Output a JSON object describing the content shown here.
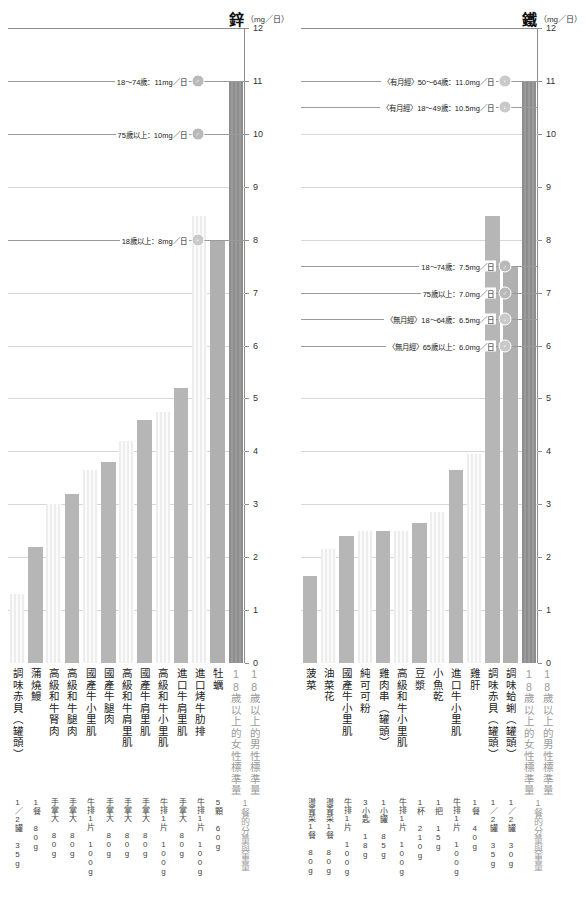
{
  "charts": [
    {
      "id": "zinc",
      "title": "鋅",
      "unit": "（mg／日）",
      "ylim": [
        0,
        12
      ],
      "yticks": [
        "0",
        "1",
        "2",
        "3",
        "4",
        "5",
        "6",
        "7",
        "8",
        "9",
        "10",
        "11",
        "12"
      ],
      "categories": [
        "調味赤貝（罐頭）",
        "蒲燒鰻",
        "高級和牛腎肉",
        "高級和牛腿肉",
        "國產牛小里肌",
        "國產牛腿肉",
        "高級和牛肩里肌",
        "國產牛肩里肌",
        "高級和牛小里肌",
        "進口牛肩里肌",
        "進口烤牛肋排",
        "牡蠣"
      ],
      "values": [
        1.3,
        2.2,
        3.0,
        3.2,
        3.65,
        3.8,
        4.2,
        4.6,
        4.75,
        5.2,
        8.45
      ],
      "patterns": [
        "stripe",
        "solid",
        "stripe",
        "solid",
        "stripe",
        "solid",
        "stripe",
        "solid",
        "stripe",
        "solid",
        "stripe"
      ],
      "servings": [
        "1／2罐 35g",
        "1餐 80g",
        "手掌大 80g",
        "手掌大 80g",
        "牛排1片 100g",
        "手掌大 80g",
        "手掌大 80g",
        "手掌大 80g",
        "牛排1片 100g",
        "手掌大 80g",
        "牛排1片 100g",
        "5顆 60g"
      ],
      "standards": [
        {
          "name": "18歲以上的女性標準量",
          "value": 8,
          "style": "std-female"
        },
        {
          "name": "18歲以上的男性標準量",
          "value": 11,
          "style": "std-male"
        }
      ],
      "standard_note": "1餐的分量與重量",
      "annotations": [
        {
          "text": "18〜74歲：11mg／日",
          "value": 11,
          "sex": "male",
          "symbol": "♂"
        },
        {
          "text": "75歲以上：10mg／日",
          "value": 10,
          "sex": "male",
          "symbol": "♂"
        },
        {
          "text": "18歲以上：8mg／日",
          "value": 8,
          "sex": "female",
          "symbol": "♀"
        }
      ]
    },
    {
      "id": "iron",
      "title": "鐵",
      "unit": "（mg／日）",
      "ylim": [
        0,
        12
      ],
      "yticks": [
        "0",
        "1",
        "2",
        "3",
        "4",
        "5",
        "6",
        "7",
        "8",
        "9",
        "10",
        "11",
        "12"
      ],
      "categories": [
        "菠菜",
        "油菜花",
        "國產牛小里肌",
        "純可可粉",
        "雞肉串（罐頭）",
        "高級和牛小里肌",
        "豆漿",
        "小魚乾",
        "進口牛小里肌",
        "雞肝",
        "調味赤貝（罐頭）",
        "調味蛤蜊（罐頭）"
      ],
      "values": [
        1.65,
        2.15,
        2.4,
        2.5,
        2.5,
        2.5,
        2.65,
        2.85,
        3.65,
        3.95,
        8.45
      ],
      "patterns": [
        "solid",
        "stripe",
        "solid",
        "stripe",
        "solid",
        "stripe",
        "solid",
        "stripe",
        "solid",
        "stripe",
        "solid"
      ],
      "servings": [
        "燙青菜1餐 80g",
        "燙青菜1餐 80g",
        "牛排1片 100g",
        "3小匙 18g",
        "1小罐 85g",
        "牛排1片 100g",
        "1杯 210g",
        "1把 15g",
        "牛排1片 100g",
        "1餐 40g",
        "1／2罐 35g",
        "1／2罐 30g"
      ],
      "standards": [
        {
          "name": "18歲以上的女性標準量",
          "value": 7.5,
          "style": "std-female"
        },
        {
          "name": "18歲以上的男性標準量",
          "value": 11,
          "style": "std-male"
        }
      ],
      "standard_note": "1餐的分量與重量",
      "annotations": [
        {
          "text": "〈有月經〉50〜64歲：11.0mg／日",
          "value": 11,
          "sex": "female",
          "symbol": "♀"
        },
        {
          "text": "〈有月經〉18〜49歲：10.5mg／日",
          "value": 10.5,
          "sex": "female",
          "symbol": "♀"
        },
        {
          "text": "18〜74歲：7.5mg／日",
          "value": 7.5,
          "sex": "male",
          "symbol": "♂"
        },
        {
          "text": "75歲以上：7.0mg／日",
          "value": 7.0,
          "sex": "male",
          "symbol": "♂"
        },
        {
          "text": "〈無月經〉18〜64歲：6.5mg／日",
          "value": 6.5,
          "sex": "female",
          "symbol": "♀"
        },
        {
          "text": "〈無月經〉65歲以上：6.0mg／日",
          "value": 6.0,
          "sex": "female",
          "symbol": "♀"
        }
      ]
    }
  ],
  "chart_data": {
    "type": "bar",
    "panels": [
      {
        "name": "鋅",
        "ylabel": "鋅（mg／日）",
        "ylim": [
          0,
          12
        ],
        "categories": [
          "調味赤貝（罐頭）",
          "蒲燒鰻",
          "高級和牛腎肉",
          "高級和牛腿肉",
          "國產牛小里肌",
          "國產牛腿肉",
          "高級和牛肩里肌",
          "國產牛肩里肌",
          "高級和牛小里肌",
          "進口牛肩里肌",
          "進口烤牛肋排",
          "牡蠣",
          "18歲以上的女性標準量",
          "18歲以上的男性標準量"
        ],
        "values": [
          1.3,
          2.2,
          3.0,
          3.2,
          3.65,
          3.8,
          4.2,
          4.6,
          4.75,
          5.2,
          8.45,
          8.0,
          11.0
        ]
      },
      {
        "name": "鐵",
        "ylabel": "鐵（mg／日）",
        "ylim": [
          0,
          12
        ],
        "categories": [
          "菠菜",
          "油菜花",
          "國產牛小里肌",
          "純可可粉",
          "雞肉串（罐頭）",
          "高級和牛小里肌",
          "豆漿",
          "小魚乾",
          "進口牛小里肌",
          "雞肝",
          "調味赤貝（罐頭）",
          "調味蛤蜊（罐頭）",
          "18歲以上的女性標準量",
          "18歲以上的男性標準量"
        ],
        "values": [
          1.65,
          2.15,
          2.4,
          2.5,
          2.5,
          2.5,
          2.65,
          2.85,
          3.65,
          3.95,
          8.45,
          7.5,
          11.0
        ]
      }
    ],
    "grid": true,
    "legend": null
  }
}
